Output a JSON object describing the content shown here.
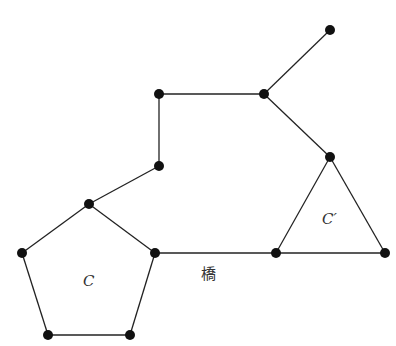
{
  "diagram": {
    "type": "graph",
    "nodes": [
      {
        "id": "p_top",
        "x": 89,
        "y": 204
      },
      {
        "id": "p_left",
        "x": 22,
        "y": 253
      },
      {
        "id": "p_bl",
        "x": 48,
        "y": 335
      },
      {
        "id": "p_br",
        "x": 130,
        "y": 335
      },
      {
        "id": "p_right",
        "x": 155,
        "y": 253
      },
      {
        "id": "m1",
        "x": 159,
        "y": 166
      },
      {
        "id": "m2",
        "x": 159,
        "y": 94
      },
      {
        "id": "m3",
        "x": 264,
        "y": 94
      },
      {
        "id": "leaf",
        "x": 330,
        "y": 30
      },
      {
        "id": "t_top",
        "x": 330,
        "y": 157
      },
      {
        "id": "t_left",
        "x": 276,
        "y": 253
      },
      {
        "id": "t_right",
        "x": 385,
        "y": 253
      }
    ],
    "edges": [
      [
        "p_top",
        "p_left"
      ],
      [
        "p_left",
        "p_bl"
      ],
      [
        "p_bl",
        "p_br"
      ],
      [
        "p_br",
        "p_right"
      ],
      [
        "p_right",
        "p_top"
      ],
      [
        "p_top",
        "m1"
      ],
      [
        "m1",
        "m2"
      ],
      [
        "m2",
        "m3"
      ],
      [
        "m3",
        "leaf"
      ],
      [
        "m3",
        "t_top"
      ],
      [
        "t_top",
        "t_left"
      ],
      [
        "t_left",
        "t_right"
      ],
      [
        "t_right",
        "t_top"
      ],
      [
        "p_right",
        "t_left"
      ]
    ],
    "labels": {
      "cycle_c": "C",
      "cycle_c_prime": "C′",
      "bridge": "橋"
    },
    "colors": {
      "edge": "#222222",
      "node": "#111111"
    }
  }
}
